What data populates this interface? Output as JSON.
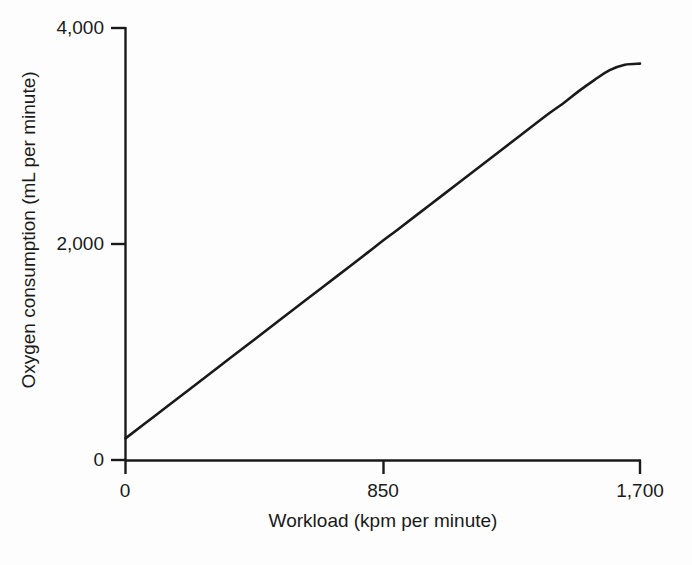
{
  "chart_data": {
    "type": "line",
    "title": "",
    "subtitle": "",
    "xlabel": "Workload (kpm per minute)",
    "ylabel": "Oxygen consumption (mL per minute)",
    "xlim": [
      0,
      1700
    ],
    "ylim": [
      0,
      4000
    ],
    "xticks": [
      0,
      850,
      1700
    ],
    "xticklabels": [
      "0",
      "850",
      "1,700"
    ],
    "yticks": [
      0,
      2000,
      4000
    ],
    "yticklabels": [
      "0",
      "2,000",
      "4,000"
    ],
    "grid": false,
    "legend": null,
    "annotations": [],
    "line_color": "#1a1a1a",
    "background_color": "#fdfdfd",
    "series": [
      {
        "name": "Oxygen consumption vs workload",
        "x": [
          0,
          100,
          200,
          300,
          400,
          500,
          600,
          700,
          800,
          850,
          900,
          1000,
          1100,
          1200,
          1300,
          1400,
          1450,
          1500,
          1550,
          1600,
          1650,
          1700
        ],
        "y": [
          200,
          415,
          630,
          845,
          1060,
          1275,
          1490,
          1705,
          1920,
          2030,
          2135,
          2350,
          2565,
          2780,
          2995,
          3210,
          3310,
          3420,
          3520,
          3610,
          3660,
          3670
        ]
      }
    ]
  },
  "axes": {
    "y_ticks": [
      {
        "label": "4,000"
      },
      {
        "label": "2,000"
      },
      {
        "label": "0"
      }
    ],
    "x_ticks": [
      {
        "label": "0"
      },
      {
        "label": "850"
      },
      {
        "label": "1,700"
      }
    ],
    "x_title": "Workload (kpm per minute)",
    "y_title": "Oxygen consumption (mL per minute)"
  }
}
